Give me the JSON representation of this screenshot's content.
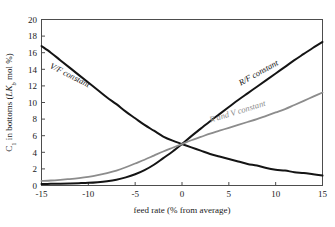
{
  "chart_data": {
    "type": "line",
    "title": "",
    "xlabel": "feed rate (% from average)",
    "ylabel": "C₁ in bottoms (LKb mol %)",
    "ylabel_parts": {
      "lead": "C",
      "sub1": "1",
      "mid": " in bottoms (",
      "italic": "LK",
      "sub2": "b",
      "tail": " mol %)"
    },
    "xlim": [
      -15,
      15
    ],
    "ylim": [
      0,
      20
    ],
    "xticks": [
      -15,
      -10,
      -5,
      0,
      5,
      10,
      15
    ],
    "xticklabels": [
      "-15",
      "-10",
      "-5",
      "0",
      "5",
      "10",
      "15"
    ],
    "yticks": [
      0,
      2,
      4,
      6,
      8,
      10,
      12,
      14,
      16,
      18,
      20
    ],
    "yticklabels": [
      "0",
      "2",
      "4",
      "6",
      "8",
      "10",
      "12",
      "14",
      "16",
      "18",
      "20"
    ],
    "grid": false,
    "legend": "inline-annotations",
    "series": [
      {
        "name": "V/F constant",
        "label": "V/F constant",
        "color": "#141414",
        "width": 2.0,
        "label_rotation": 27,
        "label_x": -12.1,
        "label_y": 13.0,
        "x": [
          -15,
          -14,
          -13,
          -12,
          -11,
          -10,
          -9,
          -8,
          -7,
          -6,
          -5,
          -4,
          -3,
          -2,
          -1,
          0,
          1,
          2,
          3,
          4,
          5,
          6,
          7,
          8,
          9,
          10,
          11,
          12,
          13,
          14,
          15
        ],
        "values": [
          16.8,
          16.0,
          15.1,
          14.2,
          13.3,
          12.4,
          11.5,
          10.6,
          9.8,
          8.9,
          8.1,
          7.3,
          6.6,
          5.9,
          5.4,
          5.0,
          4.6,
          4.2,
          3.8,
          3.5,
          3.2,
          2.9,
          2.6,
          2.4,
          2.1,
          1.9,
          1.8,
          1.6,
          1.5,
          1.35,
          1.2
        ]
      },
      {
        "name": "R/F constant",
        "label": "R/F constant",
        "color": "#141414",
        "width": 2.0,
        "label_rotation": -29,
        "label_x": 8.3,
        "label_y": 13.3,
        "x": [
          -15,
          -14,
          -13,
          -12,
          -11,
          -10,
          -9,
          -8,
          -7,
          -6,
          -5,
          -4,
          -3,
          -2,
          -1,
          0,
          1,
          2,
          3,
          4,
          5,
          6,
          7,
          8,
          9,
          10,
          11,
          12,
          13,
          14,
          15
        ],
        "values": [
          0.18,
          0.2,
          0.22,
          0.25,
          0.28,
          0.32,
          0.4,
          0.52,
          0.7,
          0.98,
          1.35,
          1.85,
          2.5,
          3.3,
          4.1,
          5.0,
          5.95,
          6.85,
          7.75,
          8.6,
          9.45,
          10.3,
          11.1,
          11.9,
          12.7,
          13.5,
          14.3,
          15.1,
          15.85,
          16.6,
          17.3
        ]
      },
      {
        "name": "R and V constant",
        "label": "R and V constant",
        "color": "#8c8c8c",
        "width": 1.8,
        "label_rotation": -17,
        "label_x": 6.0,
        "label_y": 8.6,
        "x": [
          -15,
          -14,
          -13,
          -12,
          -11,
          -10,
          -9,
          -8,
          -7,
          -6,
          -5,
          -4,
          -3,
          -2,
          -1,
          0,
          1,
          2,
          3,
          4,
          5,
          6,
          7,
          8,
          9,
          10,
          11,
          12,
          13,
          14,
          15
        ],
        "values": [
          0.55,
          0.6,
          0.68,
          0.78,
          0.9,
          1.05,
          1.25,
          1.5,
          1.8,
          2.2,
          2.65,
          3.1,
          3.6,
          4.1,
          4.55,
          5.0,
          5.45,
          5.85,
          6.25,
          6.6,
          6.95,
          7.3,
          7.65,
          8.0,
          8.4,
          8.8,
          9.2,
          9.7,
          10.2,
          10.7,
          11.2
        ]
      }
    ]
  },
  "axes": {
    "frame_color": "#4d4d4d",
    "text_color": "#1a1a1a"
  }
}
